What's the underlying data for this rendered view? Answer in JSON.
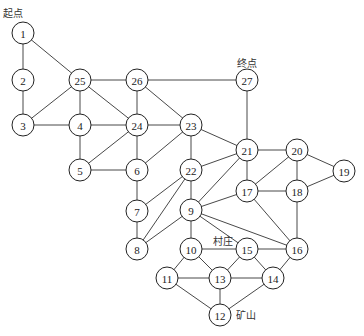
{
  "diagram": {
    "type": "undirected-graph",
    "node_radius": 11,
    "colors": {
      "edge": "#333333",
      "node_stroke": "#222222",
      "node_fill": "#ffffff",
      "text": "#222222"
    },
    "nodes": [
      {
        "id": "1",
        "x": 23,
        "y": 33
      },
      {
        "id": "2",
        "x": 23,
        "y": 80
      },
      {
        "id": "3",
        "x": 23,
        "y": 125
      },
      {
        "id": "25",
        "x": 80,
        "y": 80
      },
      {
        "id": "4",
        "x": 80,
        "y": 125
      },
      {
        "id": "5",
        "x": 80,
        "y": 170
      },
      {
        "id": "26",
        "x": 137,
        "y": 80
      },
      {
        "id": "24",
        "x": 137,
        "y": 125
      },
      {
        "id": "6",
        "x": 137,
        "y": 170
      },
      {
        "id": "7",
        "x": 137,
        "y": 211
      },
      {
        "id": "8",
        "x": 137,
        "y": 249
      },
      {
        "id": "23",
        "x": 191,
        "y": 125
      },
      {
        "id": "22",
        "x": 191,
        "y": 170
      },
      {
        "id": "9",
        "x": 191,
        "y": 210
      },
      {
        "id": "10",
        "x": 191,
        "y": 249
      },
      {
        "id": "27",
        "x": 247,
        "y": 80
      },
      {
        "id": "21",
        "x": 247,
        "y": 150
      },
      {
        "id": "17",
        "x": 247,
        "y": 191
      },
      {
        "id": "20",
        "x": 297,
        "y": 150
      },
      {
        "id": "18",
        "x": 297,
        "y": 191
      },
      {
        "id": "19",
        "x": 344,
        "y": 171
      },
      {
        "id": "15",
        "x": 247,
        "y": 249
      },
      {
        "id": "16",
        "x": 297,
        "y": 249
      },
      {
        "id": "11",
        "x": 167,
        "y": 278
      },
      {
        "id": "13",
        "x": 220,
        "y": 278
      },
      {
        "id": "14",
        "x": 273,
        "y": 278
      },
      {
        "id": "12",
        "x": 220,
        "y": 315
      }
    ],
    "edges": [
      [
        "1",
        "2"
      ],
      [
        "1",
        "25"
      ],
      [
        "2",
        "3"
      ],
      [
        "3",
        "25"
      ],
      [
        "3",
        "4"
      ],
      [
        "25",
        "4"
      ],
      [
        "25",
        "24"
      ],
      [
        "25",
        "26"
      ],
      [
        "4",
        "24"
      ],
      [
        "4",
        "5"
      ],
      [
        "5",
        "24"
      ],
      [
        "5",
        "6"
      ],
      [
        "26",
        "24"
      ],
      [
        "26",
        "23"
      ],
      [
        "26",
        "27"
      ],
      [
        "24",
        "23"
      ],
      [
        "24",
        "6"
      ],
      [
        "6",
        "23"
      ],
      [
        "6",
        "7"
      ],
      [
        "7",
        "22"
      ],
      [
        "7",
        "8"
      ],
      [
        "8",
        "22"
      ],
      [
        "8",
        "9"
      ],
      [
        "23",
        "22"
      ],
      [
        "23",
        "21"
      ],
      [
        "22",
        "21"
      ],
      [
        "22",
        "9"
      ],
      [
        "9",
        "21"
      ],
      [
        "9",
        "17"
      ],
      [
        "9",
        "10"
      ],
      [
        "9",
        "15"
      ],
      [
        "9",
        "16"
      ],
      [
        "27",
        "21"
      ],
      [
        "21",
        "20"
      ],
      [
        "21",
        "17"
      ],
      [
        "20",
        "17"
      ],
      [
        "20",
        "18"
      ],
      [
        "20",
        "19"
      ],
      [
        "17",
        "18"
      ],
      [
        "17",
        "16"
      ],
      [
        "18",
        "19"
      ],
      [
        "18",
        "16"
      ],
      [
        "10",
        "15"
      ],
      [
        "10",
        "13"
      ],
      [
        "10",
        "11"
      ],
      [
        "15",
        "13"
      ],
      [
        "15",
        "16"
      ],
      [
        "15",
        "14"
      ],
      [
        "16",
        "14"
      ],
      [
        "11",
        "13"
      ],
      [
        "11",
        "12"
      ],
      [
        "13",
        "14"
      ],
      [
        "13",
        "12"
      ],
      [
        "14",
        "12"
      ]
    ],
    "annotations": [
      {
        "key": "start",
        "text": "起点",
        "x": 3,
        "y": 13,
        "anchor": "start"
      },
      {
        "key": "end",
        "text": "终点",
        "x": 247,
        "y": 63,
        "anchor": "middle"
      },
      {
        "key": "village",
        "text": "村庄",
        "x": 213,
        "y": 241,
        "anchor": "start"
      },
      {
        "key": "mine",
        "text": "矿山",
        "x": 236,
        "y": 315,
        "anchor": "start"
      }
    ]
  }
}
